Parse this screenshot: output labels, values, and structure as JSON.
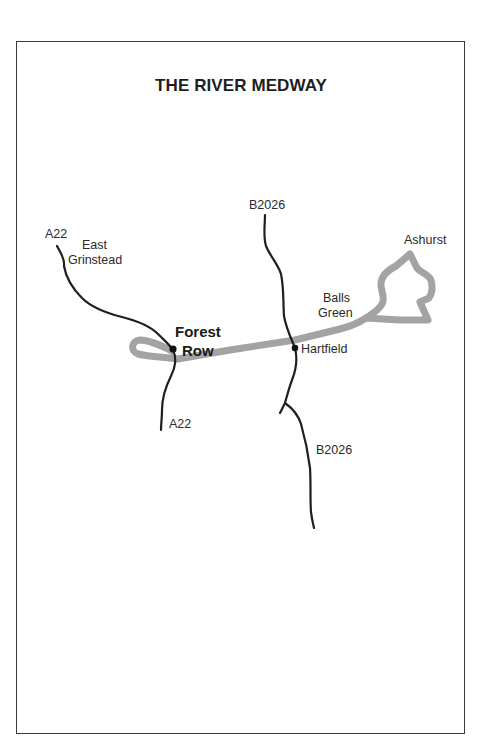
{
  "map": {
    "title": "THE RIVER MEDWAY",
    "colors": {
      "river": "#a3a3a3",
      "road": "#1f1f1f",
      "border": "#3a3a3a",
      "text": "#2a2a2a"
    },
    "roads": [
      {
        "name": "A22",
        "segment": "north",
        "label": "A22"
      },
      {
        "name": "A22",
        "segment": "south",
        "label": "A22"
      },
      {
        "name": "B2026",
        "segment": "north",
        "label": "B2026"
      },
      {
        "name": "B2026",
        "segment": "south",
        "label": "B2026"
      }
    ],
    "places": {
      "east_grinstead_line1": "East",
      "east_grinstead_line2": "Grinstead",
      "forest_row_line1": "Forest",
      "forest_row_line2": "Row",
      "hartfield": "Hartfield",
      "balls_green_line1": "Balls",
      "balls_green_line2": "Green",
      "ashurst": "Ashurst"
    },
    "road_labels": {
      "a22_north": "A22",
      "a22_south": "A22",
      "b2026_north": "B2026",
      "b2026_south": "B2026"
    },
    "river": {
      "name": "River Medway"
    }
  }
}
